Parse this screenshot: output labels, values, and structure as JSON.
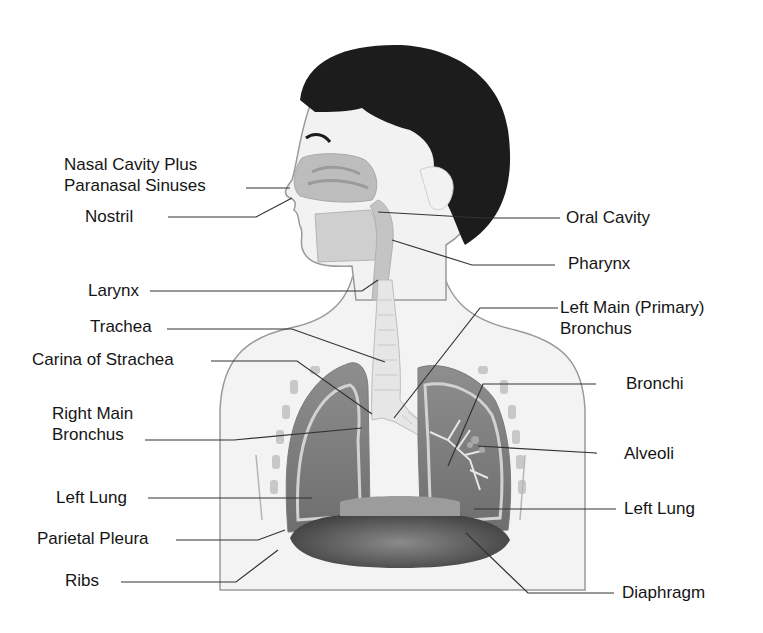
{
  "diagram": {
    "type": "anatomy-labeled-illustration",
    "colors": {
      "hair": "#1c1c1c",
      "skin": "#f1f1f1",
      "outline": "#9a9a9a",
      "lung_outer": "#7d7d7d",
      "lung_inner": "#9a9a9a",
      "pleura": "#c9c9c9",
      "diaphragm": "#4a4a4a",
      "trachea": "#e4e4e4",
      "leader_line": "#333333",
      "label_text": "#151515"
    },
    "labels_left": [
      {
        "id": "nasal-cavity",
        "lines": [
          "Nasal Cavity Plus",
          "Paranasal Sinuses"
        ]
      },
      {
        "id": "nostril",
        "lines": [
          "Nostril"
        ]
      },
      {
        "id": "larynx",
        "lines": [
          "Larynx"
        ]
      },
      {
        "id": "trachea",
        "lines": [
          "Trachea"
        ]
      },
      {
        "id": "carina",
        "lines": [
          "Carina of Strachea"
        ]
      },
      {
        "id": "right-main-bronchus",
        "lines": [
          "Right Main",
          "Bronchus"
        ]
      },
      {
        "id": "left-lung-left",
        "lines": [
          "Left Lung"
        ]
      },
      {
        "id": "parietal-pleura",
        "lines": [
          "Parietal Pleura"
        ]
      },
      {
        "id": "ribs",
        "lines": [
          "Ribs"
        ]
      }
    ],
    "labels_right": [
      {
        "id": "oral-cavity",
        "lines": [
          "Oral Cavity"
        ]
      },
      {
        "id": "pharynx",
        "lines": [
          "Pharynx"
        ]
      },
      {
        "id": "left-main-bronchus",
        "lines": [
          "Left Main (Primary)",
          "Bronchus"
        ]
      },
      {
        "id": "bronchi",
        "lines": [
          "Bronchi"
        ]
      },
      {
        "id": "alveoli",
        "lines": [
          "Alveoli"
        ]
      },
      {
        "id": "left-lung-right",
        "lines": [
          "Left Lung"
        ]
      },
      {
        "id": "diaphragm",
        "lines": [
          "Diaphragm"
        ]
      }
    ]
  }
}
